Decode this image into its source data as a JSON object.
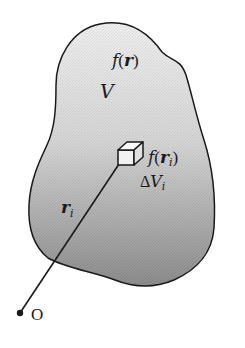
{
  "diagram": {
    "region_label": "V",
    "field_label": {
      "func": "f",
      "open": "(",
      "arg": "r",
      "close": ")"
    },
    "element_field_label": {
      "func": "f",
      "open": "(",
      "arg": "r",
      "sub": "i",
      "close": ")"
    },
    "element_volume_label": {
      "delta": "Δ",
      "var": "V",
      "sub": "i"
    },
    "position_vector_label": {
      "var": "r",
      "sub": "i"
    },
    "origin_label": "O",
    "colors": {
      "outline": "#1a1a1a",
      "fill_top": "#ececec",
      "fill_bottom": "#8f8f8f",
      "background": "#ffffff"
    }
  }
}
